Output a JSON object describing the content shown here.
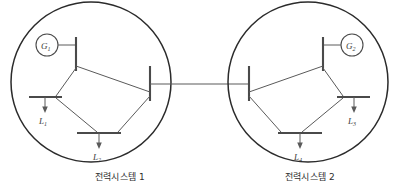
{
  "figure": {
    "type": "power-system-one-line-diagram",
    "background_color": "#ffffff",
    "line_color": "#4a4a4a",
    "boundary_color": "#2b2b2b",
    "text_color": "#2e2e2e"
  },
  "systems": [
    {
      "id": "system-1",
      "caption": "전력시스템 1",
      "boundary": {
        "cx": 91,
        "cy": 82,
        "r": 80
      },
      "generator": {
        "name": "G",
        "index": "1",
        "label": "G",
        "subscript": "1",
        "circle": {
          "cx": 47,
          "cy": 45,
          "r": 11
        }
      },
      "buses": [
        {
          "id": "bus-gen-1",
          "orientation": "vertical",
          "x": 76,
          "y1": 37,
          "y2": 71
        },
        {
          "id": "bus-load-1",
          "orientation": "horizontal",
          "y": 97,
          "x1": 29,
          "x2": 62
        },
        {
          "id": "bus-load-2",
          "orientation": "horizontal",
          "y": 133,
          "x1": 77,
          "x2": 121
        },
        {
          "id": "bus-tie-1",
          "orientation": "vertical",
          "x": 150,
          "y1": 66,
          "y2": 101
        }
      ],
      "loads": [
        {
          "label": "L",
          "subscript": "1",
          "x": 45,
          "y_top": 97,
          "y_bottom": 110,
          "text_x": 40,
          "text_y": 122
        },
        {
          "label": "L",
          "subscript": "2",
          "x": 99,
          "y_top": 133,
          "y_bottom": 146,
          "text_x": 94,
          "text_y": 158
        }
      ],
      "branches": [
        {
          "from": "bus-gen-1",
          "to": "bus-load-1"
        },
        {
          "from": "bus-gen-1",
          "to": "bus-tie-1"
        },
        {
          "from": "bus-load-1",
          "to": "bus-load-2"
        },
        {
          "from": "bus-load-2",
          "to": "bus-tie-1"
        }
      ]
    },
    {
      "id": "system-2",
      "caption": "전력시스템 2",
      "boundary": {
        "cx": 308,
        "cy": 82,
        "r": 80
      },
      "generator": {
        "name": "G",
        "index": "2",
        "label": "G",
        "subscript": "2",
        "circle": {
          "cx": 352,
          "cy": 45,
          "r": 11
        }
      },
      "buses": [
        {
          "id": "bus-gen-2",
          "orientation": "vertical",
          "x": 323,
          "y1": 37,
          "y2": 71
        },
        {
          "id": "bus-load-3",
          "orientation": "horizontal",
          "y": 97,
          "x1": 337,
          "x2": 370
        },
        {
          "id": "bus-load-4",
          "orientation": "horizontal",
          "y": 133,
          "x1": 278,
          "x2": 322
        },
        {
          "id": "bus-tie-2",
          "orientation": "vertical",
          "x": 249,
          "y1": 66,
          "y2": 101
        }
      ],
      "loads": [
        {
          "label": "L",
          "subscript": "3",
          "x": 354,
          "y_top": 97,
          "y_bottom": 110,
          "text_x": 349,
          "text_y": 122
        },
        {
          "label": "L",
          "subscript": "4",
          "x": 300,
          "y_top": 133,
          "y_bottom": 146,
          "text_x": 295,
          "text_y": 158
        }
      ],
      "branches": [
        {
          "from": "bus-gen-2",
          "to": "bus-load-3"
        },
        {
          "from": "bus-gen-2",
          "to": "bus-tie-2"
        },
        {
          "from": "bus-load-3",
          "to": "bus-load-4"
        },
        {
          "from": "bus-load-4",
          "to": "bus-tie-2"
        }
      ]
    }
  ],
  "interconnection": {
    "id": "tie-line",
    "label": "",
    "from_x": 150,
    "to_x": 249,
    "y": 84
  }
}
